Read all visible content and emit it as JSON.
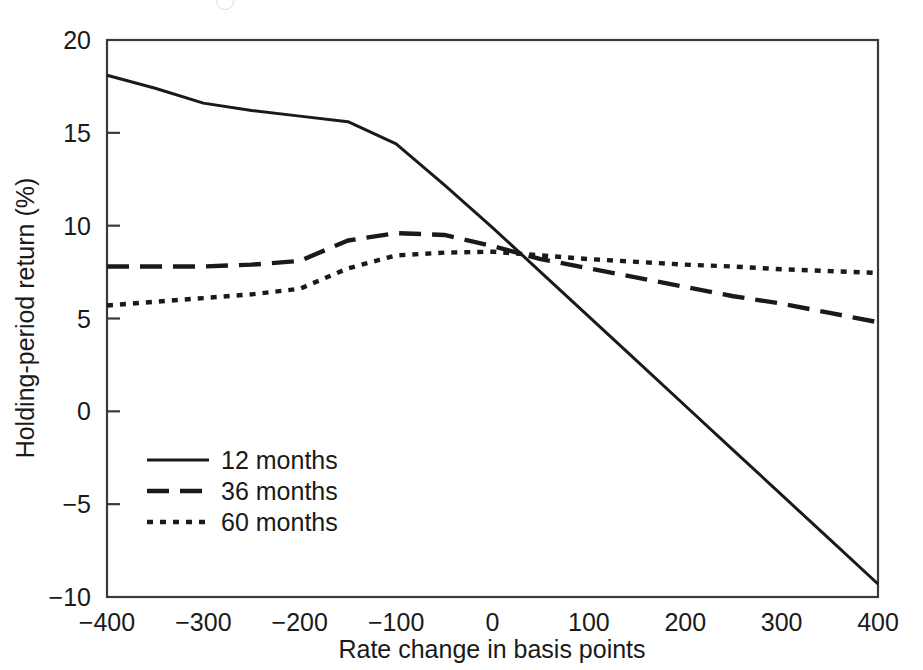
{
  "chart_data": {
    "type": "line",
    "title": "",
    "xlabel": "Rate change in basis points",
    "ylabel": "Holding-period return (%)",
    "xlim": [
      -400,
      400
    ],
    "ylim": [
      -10,
      20
    ],
    "xticks": [
      -400,
      -300,
      -200,
      -100,
      0,
      100,
      200,
      300,
      400
    ],
    "xticklabels": [
      "−400",
      "−300",
      "−200",
      "−100",
      "0",
      "100",
      "200",
      "300",
      "400"
    ],
    "yticks": [
      -10,
      -5,
      0,
      5,
      10,
      15,
      20
    ],
    "yticklabels": [
      "−10",
      "−5",
      "0",
      "5",
      "10",
      "15",
      "20"
    ],
    "grid": false,
    "legend_position": "lower left",
    "series": [
      {
        "name": "12 months",
        "style": "solid",
        "x": [
          -400,
          -350,
          -300,
          -250,
          -200,
          -150,
          -100,
          -50,
          0,
          50,
          100,
          150,
          200,
          250,
          300,
          350,
          400
        ],
        "values": [
          18.1,
          17.4,
          16.6,
          16.2,
          15.9,
          15.6,
          14.4,
          12.2,
          9.9,
          7.5,
          5.1,
          2.7,
          0.3,
          -2.1,
          -4.5,
          -6.9,
          -9.3
        ]
      },
      {
        "name": "36 months",
        "style": "dashed",
        "x": [
          -400,
          -350,
          -300,
          -250,
          -200,
          -150,
          -100,
          -50,
          0,
          50,
          100,
          150,
          200,
          250,
          300,
          350,
          400
        ],
        "values": [
          7.8,
          7.8,
          7.8,
          7.9,
          8.1,
          9.2,
          9.6,
          9.5,
          8.9,
          8.2,
          7.7,
          7.2,
          6.7,
          6.2,
          5.8,
          5.3,
          4.8
        ]
      },
      {
        "name": "60 months",
        "style": "dotted",
        "x": [
          -400,
          -350,
          -300,
          -250,
          -200,
          -150,
          -100,
          -50,
          0,
          50,
          100,
          150,
          200,
          250,
          300,
          350,
          400
        ],
        "values": [
          5.7,
          5.9,
          6.1,
          6.3,
          6.6,
          7.7,
          8.4,
          8.55,
          8.6,
          8.4,
          8.2,
          8.05,
          7.9,
          7.8,
          7.65,
          7.55,
          7.45
        ]
      }
    ]
  },
  "legend": {
    "items": [
      {
        "label": "12 months",
        "style": "solid"
      },
      {
        "label": "36 months",
        "style": "dashed"
      },
      {
        "label": "60 months",
        "style": "dotted"
      }
    ]
  },
  "colors": {
    "line": "#1a1a1a",
    "axis": "#3a3a3a",
    "text": "#1a1a1a",
    "background": "#ffffff"
  }
}
